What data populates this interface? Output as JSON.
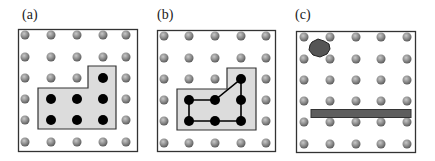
{
  "panels": [
    {
      "id": "a",
      "label": "(a)",
      "description": "6x5 peg grid with shaded L-shaped region enclosing 7 black pegs"
    },
    {
      "id": "b",
      "label": "(b)",
      "description": "same shaded region; 7 black pegs connected by a polygon outline"
    },
    {
      "id": "c",
      "label": "(c)",
      "description": "peg grid with a dark blob near top-left and a long horizontal bar between rows 4 and 5"
    }
  ],
  "grid": {
    "rows": 6,
    "cols": 5
  },
  "colors": {
    "peg": "#8a8a8a",
    "peg_active": "#000000",
    "region_fill": "#dcdcdc",
    "frame": "#333333",
    "blob": "#555555",
    "bar": "#5e5e5e"
  }
}
